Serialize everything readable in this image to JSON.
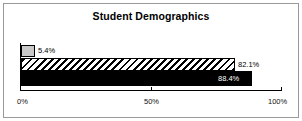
{
  "chart_data": {
    "type": "bar",
    "orientation": "horizontal",
    "title": "Student Demographics",
    "xlabel": "",
    "ylabel": "",
    "categories": [
      "series-1",
      "series-2",
      "series-3"
    ],
    "values": [
      5.4,
      82.1,
      88.4
    ],
    "data_labels": [
      "5.4%",
      "82.1%",
      "88.4%"
    ],
    "xlim": [
      0,
      100
    ],
    "xticks": [
      0,
      50,
      100
    ],
    "xtick_labels": [
      "0%",
      "50%",
      "100%"
    ],
    "grid": false,
    "legend": "none",
    "series_styles": [
      "solid-light-gray",
      "diagonal-hatch",
      "solid-black"
    ],
    "colors": {
      "bar_gray": "#c9c9c9",
      "bar_hatch_fill": "#ffffff",
      "bar_hatch_lines": "#000000",
      "bar_black": "#000000",
      "outline": "#000000",
      "axis": "#000000",
      "frame": "#9a9a9a",
      "text": "#000000",
      "text_inverse": "#ffffff",
      "background": "#ffffff"
    }
  },
  "axis": {
    "tick_0": "0%",
    "tick_50": "50%",
    "tick_100": "100%"
  },
  "bars": {
    "gray_label": "5.4%",
    "hatch_label": "82.1%",
    "black_label": "88.4%"
  }
}
